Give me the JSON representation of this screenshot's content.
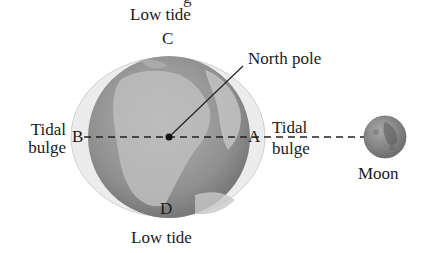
{
  "top_fragment": "g",
  "labels": {
    "low_tide_top": "Low tide",
    "low_tide_bottom": "Low tide",
    "north_pole": "North pole",
    "tidal_bulge_left_1": "Tidal",
    "tidal_bulge_left_2": "bulge",
    "tidal_bulge_right_1": "Tidal",
    "tidal_bulge_right_2": "bulge",
    "moon": "Moon"
  },
  "points": {
    "A": "A",
    "B": "B",
    "C": "C",
    "D": "D"
  },
  "colors": {
    "bulge_fill": "#ececec",
    "earth_base": "#9a9a9a",
    "land": "#c4c4c4",
    "moon": "#8e8e8e",
    "line": "#222222"
  }
}
